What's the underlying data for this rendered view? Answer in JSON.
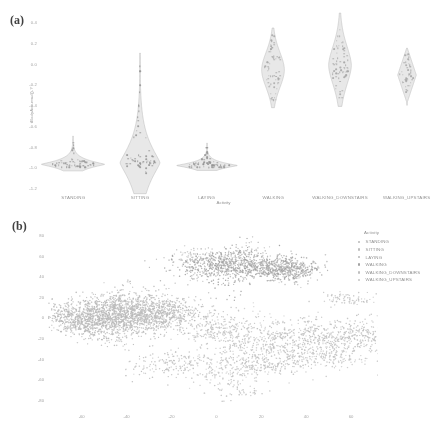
{
  "figure": {
    "background": "#ffffff",
    "panels": [
      {
        "letter": "(a)"
      },
      {
        "letter": "(b)"
      }
    ]
  },
  "panel_a": {
    "letter": "(a)",
    "axis_label_y": "tBodyAcc-mad()-Y",
    "axis_label_x": "Activity"
  },
  "panel_b": {
    "letter": "(b)",
    "legend_title": "Activity"
  },
  "legend": {
    "title": "Activity",
    "items": [
      {
        "label": "STANDING",
        "color": "#b8b8b8"
      },
      {
        "label": "SITTING",
        "color": "#bdbdbd"
      },
      {
        "label": "LAYING",
        "color": "#b4b4b4"
      },
      {
        "label": "WALKING",
        "color": "#9e9e9e"
      },
      {
        "label": "WALKING_DOWNSTAIRS",
        "color": "#c0c0c0"
      },
      {
        "label": "WALKING_UPSTAIRS",
        "color": "#c6c6c6"
      }
    ]
  },
  "chart_data": [
    {
      "type": "violin",
      "panel": "(a)",
      "title": "",
      "xlabel": "Activity",
      "ylabel": "tBodyAcc-mad()-Y",
      "ylim": [
        -1.2,
        0.4
      ],
      "yticks": [
        0.4,
        0.2,
        0.0,
        -0.2,
        -0.4,
        -0.6,
        -0.8,
        -1.0,
        -1.2
      ],
      "ytick_labels": [
        "0.4",
        "0.2",
        "0.0",
        "-0.2",
        "-0.4",
        "-0.6",
        "-0.8",
        "-1.0",
        "-1.2"
      ],
      "grid": false,
      "legend": "none",
      "categories": [
        "STANDING",
        "SITTING",
        "LAYING",
        "WALKING",
        "WALKING_DOWNSTAIRS",
        "WALKING_UPSTAIRS"
      ],
      "series": [
        {
          "name": "STANDING",
          "median": -0.975,
          "q1": -0.985,
          "q3": -0.962,
          "min": -1.0,
          "max": -0.74,
          "max_density_y": -0.975,
          "max_half_width": 0.48,
          "shape": "wide-flat-spike",
          "n_points": 60
        },
        {
          "name": "SITTING",
          "median": -0.955,
          "q1": -0.972,
          "q3": -0.93,
          "min": -1.13,
          "max": -0.02,
          "max_density_y": -0.955,
          "max_half_width": 0.3,
          "shape": "teardrop-long-tail",
          "n_points": 60
        },
        {
          "name": "LAYING",
          "median": -0.985,
          "q1": -0.992,
          "q3": -0.972,
          "min": -1.0,
          "max": -0.8,
          "max_density_y": -0.985,
          "max_half_width": 0.46,
          "shape": "wide-flat-spike",
          "n_points": 60
        },
        {
          "name": "WALKING",
          "median": -0.055,
          "q1": -0.14,
          "q3": 0.055,
          "min": -0.35,
          "max": 0.27,
          "max_density_y": -0.06,
          "max_half_width": 0.17,
          "shape": "spindle",
          "n_points": 70
        },
        {
          "name": "WALKING_DOWNSTAIRS",
          "median": -0.015,
          "q1": -0.085,
          "q3": 0.045,
          "min": -0.33,
          "max": 0.4,
          "max_density_y": -0.02,
          "max_half_width": 0.17,
          "shape": "spindle-tall-tail",
          "n_points": 70
        },
        {
          "name": "WALKING_UPSTAIRS",
          "median": -0.115,
          "q1": -0.165,
          "q3": -0.07,
          "min": -0.35,
          "max": 0.09,
          "max_density_y": -0.115,
          "max_half_width": 0.14,
          "shape": "diamond",
          "n_points": 45
        }
      ]
    },
    {
      "type": "scatter",
      "panel": "(b)",
      "title": "",
      "xlabel": "",
      "ylabel": "",
      "xlim": [
        -75,
        72
      ],
      "ylim": [
        -88,
        85
      ],
      "xticks": [
        -60,
        -40,
        -20,
        0,
        20,
        40,
        60
      ],
      "xtick_labels": [
        "-60",
        "-40",
        "-20",
        "0",
        "20",
        "40",
        "60"
      ],
      "yticks": [
        80,
        60,
        40,
        20,
        0,
        -20,
        -40,
        -60,
        -80
      ],
      "ytick_labels": [
        "80",
        "60",
        "40",
        "20",
        "0",
        "-20",
        "-40",
        "-60",
        "-80"
      ],
      "grid": false,
      "legend": "right-outside",
      "legend_title": "Activity",
      "description": "t-SNE embedding of activity recognition features; three macro-clusters: a large dense static cluster on the left (STANDING+SITTING), a dense WALKING cluster upper-right, and diffuse WALKING_UPSTAIRS / WALKING_DOWNSTAIRS clouds lower-right; LAYING separated.",
      "series": [
        {
          "name": "STANDING",
          "color": "#b8b8b8",
          "n_points": 780,
          "cluster_center": [
            -45,
            2
          ],
          "cluster_spread": [
            17,
            13
          ]
        },
        {
          "name": "SITTING",
          "color": "#bdbdbd",
          "n_points": 720,
          "cluster_center": [
            -40,
            4
          ],
          "cluster_spread": [
            18,
            14
          ]
        },
        {
          "name": "LAYING",
          "color": "#b4b4b4",
          "n_points": 640,
          "cluster_center": [
            13,
            52
          ],
          "cluster_spread": [
            16,
            11
          ]
        },
        {
          "name": "WALKING",
          "color": "#9e9e9e",
          "n_points": 560,
          "cluster_center": [
            10,
            48
          ],
          "cluster_spread": [
            15,
            10
          ]
        },
        {
          "name": "WALKING_DOWNSTAIRS",
          "color": "#c0c0c0",
          "n_points": 430,
          "cluster_center": [
            30,
            -22
          ],
          "cluster_spread": [
            24,
            16
          ]
        },
        {
          "name": "WALKING_UPSTAIRS",
          "color": "#c6c6c6",
          "n_points": 470,
          "cluster_center": [
            18,
            -30
          ],
          "cluster_spread": [
            26,
            18
          ]
        }
      ]
    }
  ]
}
